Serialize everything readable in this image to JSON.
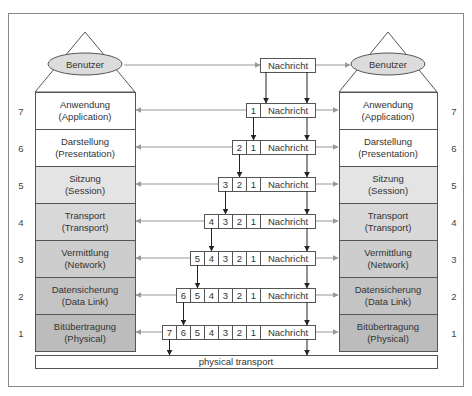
{
  "diagram": {
    "user_label": "Benutzer",
    "message_label": "Nachricht",
    "physical_transport_label": "physical transport",
    "layers": [
      {
        "number": "7",
        "name": "Anwendung",
        "english": "(Application)",
        "fill": "#ffffff"
      },
      {
        "number": "6",
        "name": "Darstellung",
        "english": "(Presentation)",
        "fill": "#ffffff"
      },
      {
        "number": "5",
        "name": "Sitzung",
        "english": "(Session)",
        "fill": "#e4e4e4"
      },
      {
        "number": "4",
        "name": "Transport",
        "english": "(Transport)",
        "fill": "#d8d8d8"
      },
      {
        "number": "3",
        "name": "Vermittlung",
        "english": "(Network)",
        "fill": "#cdcdcd"
      },
      {
        "number": "2",
        "name": "Datensicherung",
        "english": "(Data Link)",
        "fill": "#c4c4c4"
      },
      {
        "number": "1",
        "name": "Bitübertragung",
        "english": "(Physical)",
        "fill": "#bcbcbc"
      }
    ],
    "packets": [
      {
        "headers": []
      },
      {
        "headers": [
          "1"
        ]
      },
      {
        "headers": [
          "2",
          "1"
        ]
      },
      {
        "headers": [
          "3",
          "2",
          "1"
        ]
      },
      {
        "headers": [
          "4",
          "3",
          "2",
          "1"
        ]
      },
      {
        "headers": [
          "5",
          "4",
          "3",
          "2",
          "1"
        ]
      },
      {
        "headers": [
          "6",
          "5",
          "4",
          "3",
          "2",
          "1"
        ]
      },
      {
        "headers": [
          "7",
          "6",
          "5",
          "4",
          "3",
          "2",
          "1"
        ]
      }
    ],
    "colors": {
      "line": "#555555",
      "arrow_gray": "#999999",
      "ellipse_fill": "#dcdcdc",
      "frame": "#888888"
    }
  }
}
